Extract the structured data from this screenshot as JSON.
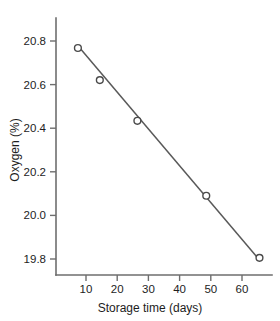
{
  "chart_data": {
    "type": "scatter",
    "title": "",
    "xlabel": "Storage time (days)",
    "ylabel": "Oxygen (%)",
    "xlim": [
      0,
      69
    ],
    "ylim": [
      19.69,
      20.89
    ],
    "xticks": [
      10,
      20,
      30,
      40,
      50,
      60
    ],
    "xtick_labels": [
      "10",
      "20",
      "30",
      "40",
      "50",
      "60"
    ],
    "yticks": [
      19.8,
      20.0,
      20.2,
      20.4,
      20.6,
      20.8
    ],
    "ytick_labels": [
      "19.8",
      "20.0",
      "20.2",
      "20.4",
      "20.6",
      "20.8"
    ],
    "grid": false,
    "legend": "none",
    "marker_style": "open-circle",
    "series": [
      {
        "name": "Oxygen measurements",
        "x": [
          7,
          14,
          26,
          48,
          65
        ],
        "y": [
          20.75,
          20.6,
          20.41,
          20.06,
          19.77
        ]
      },
      {
        "name": "Fitted line",
        "type": "line",
        "x": [
          7,
          65
        ],
        "y": [
          20.76,
          19.76
        ]
      }
    ]
  },
  "figure": {
    "background_color": "#ffffff",
    "axis_color": "#6e6e6e",
    "line_color": "#595959",
    "marker_edge_color": "#4a4a4a",
    "marker_face_color": "#ffffff",
    "text_color": "#1d1d1d"
  }
}
